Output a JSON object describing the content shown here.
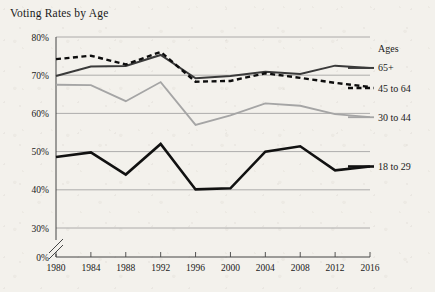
{
  "chart_data": {
    "type": "line",
    "title": "Voting Rates by Age",
    "xlabel": "",
    "ylabel": "",
    "x": [
      1980,
      1984,
      1988,
      1992,
      1996,
      2000,
      2004,
      2008,
      2012,
      2016
    ],
    "xtick_labels": [
      "1980",
      "1984",
      "1988",
      "1992",
      "1996",
      "2000",
      "2004",
      "2008",
      "2012",
      "2016"
    ],
    "ytick_labels": [
      "0%",
      "30%",
      "40%",
      "50%",
      "60%",
      "70%",
      "80%"
    ],
    "ytick_values": [
      0,
      30,
      40,
      50,
      60,
      70,
      80
    ],
    "ylim": [
      30,
      80
    ],
    "axis_break": true,
    "axis_break_label": "0%",
    "grid": true,
    "grid_axis": "y",
    "legend_position": "right",
    "legend_title": "Ages",
    "series": [
      {
        "name": "65+",
        "color": "#3a3a3a",
        "style": "solid",
        "width": 2,
        "values": [
          69.8,
          72.3,
          72.4,
          75.3,
          69.2,
          69.8,
          70.9,
          70.3,
          72.5,
          71.9
        ]
      },
      {
        "name": "45 to 64",
        "color": "#0d0d0d",
        "style": "dashed",
        "width": 2.4,
        "values": [
          74.2,
          75.1,
          72.8,
          76.1,
          68.3,
          68.5,
          70.5,
          69.3,
          68.0,
          66.9
        ]
      },
      {
        "name": "30 to 44",
        "color": "#a5a5a5",
        "style": "solid",
        "width": 1.8,
        "values": [
          67.5,
          67.4,
          63.2,
          68.2,
          57.0,
          59.5,
          62.6,
          62.0,
          59.8,
          59.0
        ]
      },
      {
        "name": "18 to 29",
        "color": "#111111",
        "style": "solid",
        "width": 2.6,
        "values": [
          48.6,
          49.8,
          44.0,
          52.0,
          40.1,
          40.4,
          50.0,
          51.4,
          45.1,
          46.1
        ]
      }
    ]
  },
  "legend": {
    "title": "Ages",
    "entries": [
      {
        "label": "65+"
      },
      {
        "label": "45 to 64"
      },
      {
        "label": "30 to 44"
      },
      {
        "label": "18 to 29"
      }
    ]
  }
}
